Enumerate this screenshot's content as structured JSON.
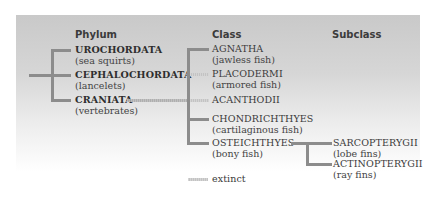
{
  "diagram": {
    "headers": {
      "phylum": "Phylum",
      "class": "Class",
      "subclass": "Subclass"
    },
    "phyla": [
      {
        "name": "UROCHORDATA",
        "common": "(sea squirts)",
        "extinct": false
      },
      {
        "name": "CEPHALOCHORDATA",
        "common": "(lancelets)",
        "extinct": false
      },
      {
        "name": "CRANIATA",
        "common": "(vertebrates)",
        "extinct": false
      }
    ],
    "classes": [
      {
        "name": "AGNATHA",
        "common": "(jawless fish)",
        "extinct": false
      },
      {
        "name": "PLACODERMI",
        "common": "(armored fish)",
        "extinct": true
      },
      {
        "name": "ACANTHODII",
        "common": "",
        "extinct": true
      },
      {
        "name": "CHONDRICHTHYES",
        "common": "(cartilaginous fish)",
        "extinct": false
      },
      {
        "name": "OSTEICHTHYES",
        "common": "(bony fish)",
        "extinct": false
      }
    ],
    "subclasses": [
      {
        "name": "SARCOPTERYGII",
        "common": "(lobe fins)",
        "extinct": false
      },
      {
        "name": "ACTINOPTERYGII",
        "common": "(ray fins)",
        "extinct": false
      }
    ],
    "legend": {
      "extinct_label": "extinct"
    },
    "colors": {
      "line": "#8c8c8c",
      "extinct_line": "#b5b5b5",
      "background_top": "#c9c9c9",
      "background_bottom": "#ffffff"
    }
  }
}
